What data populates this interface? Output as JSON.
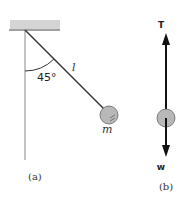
{
  "figure_a": {
    "angle_label": "45°",
    "length_label": "l",
    "mass_label": "m",
    "caption": "(a)"
  },
  "figure_b": {
    "tension_label": "T",
    "weight_label": "w",
    "caption": "(b)"
  },
  "colors": {
    "ceiling": "#d4d4d4",
    "string": "#333333",
    "bob": "#b8b8b8",
    "arrow": "#111111"
  }
}
